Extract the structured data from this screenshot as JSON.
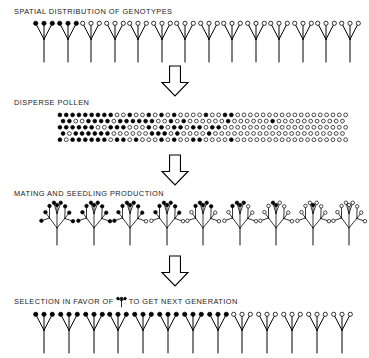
{
  "figure": {
    "width": 363,
    "height": 358,
    "background": "#ffffff",
    "ink_color": "#000000",
    "caption_color": "#1a1a1a"
  },
  "stages": [
    {
      "id": "spatial-distribution",
      "label": "SPATIAL DISTRIBUTION OF GENOTYPES",
      "label_x": 14,
      "label_y": 12,
      "kind": "plant-row",
      "row_x": 33,
      "row_y": 20,
      "plant_spacing": 23.5,
      "plant_width": 22,
      "plant_height": 42,
      "count": 14,
      "filled_tips": [
        "f",
        "f",
        "f",
        "f",
        "f",
        "f",
        "o",
        "o",
        "o",
        "o",
        "o",
        "o",
        "o",
        "o",
        "o",
        "o",
        "o",
        "o",
        "o",
        "o",
        "o",
        "o",
        "o",
        "o",
        "o",
        "o",
        "o",
        "o",
        "o",
        "o",
        "o",
        "o",
        "o",
        "o",
        "o",
        "o",
        "o",
        "o",
        "o",
        "o",
        "o",
        "o"
      ],
      "filled_plants": 2,
      "total_tips": 42,
      "description": "Fourteen three-branched plants; tips of the first two plants are filled (dark genotype), remaining tips are open circles."
    },
    {
      "id": "disperse-pollen",
      "label": "DISPERSE POLLEN",
      "label_x": 14,
      "label_y": 103,
      "kind": "pollen-band",
      "band_x": 57,
      "band_y": 112,
      "band_width": 291,
      "band_height": 30,
      "columns": 46,
      "rows": 5,
      "dot_radius": 1.9,
      "col_spacing": 6.35,
      "row_spacing": 6.2,
      "stagger": 3.15,
      "filled_fraction_start": 1.0,
      "filled_fraction_end": 0.04,
      "gradient_center_col": 18,
      "gradient_spread": 9,
      "description": "Dense staggered grid of pollen grains; fully filled at the left edge grading to open circles at the right edge."
    },
    {
      "id": "mating-seedling-production",
      "label": "MATING AND SEEDLING PRODUCTION",
      "label_x": 14,
      "label_y": 194,
      "kind": "seedling-row",
      "row_x": 40,
      "row_y": 200,
      "cluster_spacing": 36.5,
      "cluster_width": 34,
      "cluster_height": 45,
      "count": 9,
      "tips_per_cluster": 9,
      "filled_fraction_by_cluster": [
        1.0,
        1.0,
        0.89,
        0.78,
        0.55,
        0.44,
        0.22,
        0.11,
        0.0
      ],
      "description": "Nine bushy seedling clusters, each with nine branch tips; the proportion of filled tips decreases from left to right."
    },
    {
      "id": "selection",
      "label_parts": {
        "before": "SELECTION IN FAVOR OF",
        "after": "TO GET NEXT GENERATION"
      },
      "label": "SELECTION IN FAVOR OF ⑂ TO GET NEXT GENERATION",
      "label_x": 14,
      "label_y": 301,
      "kind": "plant-row",
      "row_x": 33,
      "row_y": 311,
      "plant_spacing": 24.8,
      "plant_width": 22,
      "plant_height": 42,
      "count": 13,
      "filled_plants": 8,
      "total_tips": 39,
      "description": "Thirteen plants; the first eight carry filled tips (selected genotype) and the remaining five carry open tips."
    }
  ],
  "arrows": [
    {
      "id": "arrow-1",
      "x": 162,
      "y": 66,
      "width": 26,
      "height": 30,
      "direction": "down"
    },
    {
      "id": "arrow-2",
      "x": 162,
      "y": 155,
      "width": 26,
      "height": 30,
      "direction": "down"
    },
    {
      "id": "arrow-3",
      "x": 162,
      "y": 256,
      "width": 26,
      "height": 30,
      "direction": "down"
    }
  ],
  "legend": {
    "filled_meaning": "filled circle tip",
    "open_meaning": "open circle tip"
  }
}
